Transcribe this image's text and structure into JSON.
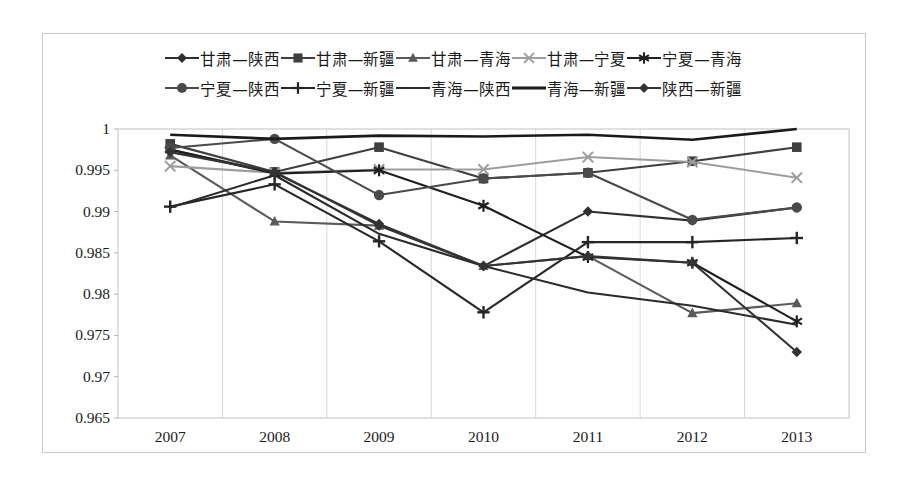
{
  "chart_data": {
    "type": "line",
    "title": "",
    "xlabel": "",
    "ylabel": "",
    "categories": [
      "2007",
      "2008",
      "2009",
      "2010",
      "2011",
      "2012",
      "2013"
    ],
    "ylim": [
      0.965,
      1.0
    ],
    "yticks": [
      "0.965",
      "0.97",
      "0.975",
      "0.98",
      "0.985",
      "0.99",
      "0.995",
      "1"
    ],
    "ytick_values": [
      0.965,
      0.97,
      0.975,
      0.98,
      0.985,
      0.99,
      0.995,
      1.0
    ],
    "grid": true,
    "legend_position": "top",
    "series": [
      {
        "name": "甘肃—陕西",
        "marker": "diamond",
        "color": "#2f2f2f",
        "values": [
          0.9975,
          0.9947,
          0.9885,
          0.9834,
          0.99,
          0.9889,
          0.9905
        ]
      },
      {
        "name": "甘肃—新疆",
        "marker": "square",
        "color": "#3f3f3f",
        "values": [
          0.9982,
          0.9948,
          0.9978,
          0.994,
          0.9947,
          0.9961,
          0.9978
        ]
      },
      {
        "name": "甘肃—青海",
        "marker": "triangle",
        "color": "#5a5a5a",
        "values": [
          0.9968,
          0.9888,
          0.9883,
          0.9834,
          0.9846,
          0.9777,
          0.9789
        ]
      },
      {
        "name": "甘肃—宁夏",
        "marker": "cross-x",
        "color": "#9d9d9d",
        "values": [
          0.9955,
          0.9947,
          0.9951,
          0.9951,
          0.9966,
          0.996,
          0.9941
        ]
      },
      {
        "name": "宁夏—青海",
        "marker": "asterisk",
        "color": "#1f1f1f",
        "values": [
          0.9975,
          0.9946,
          0.995,
          0.9907,
          0.9845,
          0.9838,
          0.9767
        ]
      },
      {
        "name": "宁夏—陕西",
        "marker": "circle",
        "color": "#4a4a4a",
        "values": [
          0.9977,
          0.9988,
          0.992,
          0.994,
          0.9947,
          0.989,
          0.9905
        ]
      },
      {
        "name": "宁夏—新疆",
        "marker": "plus",
        "color": "#262626",
        "values": [
          0.9906,
          0.9933,
          0.9864,
          0.9778,
          0.9863,
          0.9863,
          0.9868
        ]
      },
      {
        "name": "青海—陕西",
        "marker": "line",
        "color": "#2a2a2a",
        "values": [
          0.9905,
          0.9944,
          0.9873,
          0.9834,
          0.9802,
          0.9786,
          0.9763
        ]
      },
      {
        "name": "青海—新疆",
        "marker": "line-thick",
        "color": "#1a1a1a",
        "values": [
          0.9993,
          0.9988,
          0.9992,
          0.9991,
          0.9993,
          0.9987,
          1.0
        ]
      },
      {
        "name": "陕西—新疆",
        "marker": "diamond",
        "color": "#333333",
        "values": [
          0.9972,
          0.9948,
          0.9883,
          0.9834,
          0.9846,
          0.9838,
          0.973
        ]
      }
    ]
  }
}
